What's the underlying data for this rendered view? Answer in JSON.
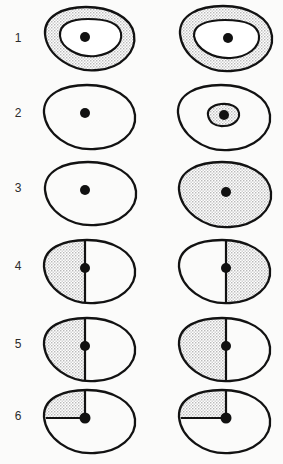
{
  "figure": {
    "title": "",
    "background_color": "#fbfbfa",
    "ink_color": "#121212",
    "shade_color": "#e2e2e2",
    "columns": 2,
    "row_labels": [
      "1",
      "2",
      "3",
      "4",
      "5",
      "6"
    ],
    "rows": [
      {
        "label": "1",
        "left": {
          "outer_fill": "shaded",
          "inner_blob": true,
          "inner_fill": "white",
          "divider": "none",
          "dot": true
        },
        "right": {
          "outer_fill": "shaded",
          "inner_blob": true,
          "inner_fill": "white",
          "divider": "none",
          "dot": true
        }
      },
      {
        "label": "2",
        "left": {
          "outer_fill": "white",
          "inner_blob": false,
          "inner_fill": "none",
          "divider": "none",
          "dot": true
        },
        "right": {
          "outer_fill": "white",
          "inner_blob": true,
          "inner_fill": "shaded",
          "divider": "none",
          "dot": true
        }
      },
      {
        "label": "3",
        "left": {
          "outer_fill": "white",
          "inner_blob": false,
          "inner_fill": "none",
          "divider": "none",
          "dot": true
        },
        "right": {
          "outer_fill": "shaded",
          "inner_blob": false,
          "inner_fill": "none",
          "divider": "none",
          "dot": true
        }
      },
      {
        "label": "4",
        "left": {
          "outer_fill": "split",
          "inner_blob": false,
          "inner_fill": "none",
          "divider": "vertical",
          "shaded_side": "left",
          "dot": true
        },
        "right": {
          "outer_fill": "split",
          "inner_blob": false,
          "inner_fill": "none",
          "divider": "vertical",
          "shaded_side": "right",
          "dot": true
        }
      },
      {
        "label": "5",
        "left": {
          "outer_fill": "split",
          "inner_blob": false,
          "inner_fill": "none",
          "divider": "vertical",
          "shaded_side": "left",
          "dot": true
        },
        "right": {
          "outer_fill": "split",
          "inner_blob": false,
          "inner_fill": "none",
          "divider": "vertical",
          "shaded_side": "left",
          "dot": true
        }
      },
      {
        "label": "6",
        "left": {
          "outer_fill": "quadrant",
          "inner_blob": false,
          "inner_fill": "none",
          "divider": "up-and-left",
          "shaded_side": "upper-left",
          "dot": true
        },
        "right": {
          "outer_fill": "quadrant",
          "inner_blob": false,
          "inner_fill": "none",
          "divider": "up-and-left",
          "shaded_side": "upper-left",
          "dot": true
        }
      }
    ]
  }
}
